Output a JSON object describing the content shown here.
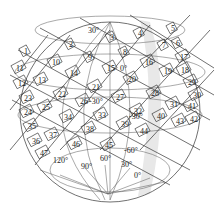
{
  "diagram": {
    "type": "sphere-grid-layout",
    "colors": {
      "stroke": "#333333",
      "background": "#ffffff",
      "shade": "#e6e6e6"
    },
    "panel_labels": [
      {
        "text": "1",
        "x": 24,
        "y": 54
      },
      {
        "text": "2",
        "x": 69,
        "y": 47
      },
      {
        "text": "3",
        "x": 110,
        "y": 40
      },
      {
        "text": "4",
        "x": 138,
        "y": 36
      },
      {
        "text": "5",
        "x": 171,
        "y": 31
      },
      {
        "text": "6",
        "x": 176,
        "y": 46
      },
      {
        "text": "7",
        "x": 162,
        "y": 48
      },
      {
        "text": "8",
        "x": 123,
        "y": 55
      },
      {
        "text": "9",
        "x": 88,
        "y": 60
      },
      {
        "text": "10",
        "x": 52,
        "y": 65
      },
      {
        "text": "11",
        "x": 16,
        "y": 71
      },
      {
        "text": "12",
        "x": 18,
        "y": 86
      },
      {
        "text": "13",
        "x": 38,
        "y": 83
      },
      {
        "text": "14",
        "x": 70,
        "y": 76
      },
      {
        "text": "15",
        "x": 107,
        "y": 71
      },
      {
        "text": "16",
        "x": 145,
        "y": 65
      },
      {
        "text": "17",
        "x": 180,
        "y": 60
      },
      {
        "text": "18",
        "x": 181,
        "y": 73
      },
      {
        "text": "19",
        "x": 164,
        "y": 74
      },
      {
        "text": "20",
        "x": 128,
        "y": 82
      },
      {
        "text": "21",
        "x": 92,
        "y": 90
      },
      {
        "text": "22",
        "x": 58,
        "y": 97
      },
      {
        "text": "23",
        "x": 24,
        "y": 101
      },
      {
        "text": "24",
        "x": 24,
        "y": 115
      },
      {
        "text": "25",
        "x": 42,
        "y": 110
      },
      {
        "text": "26",
        "x": 80,
        "y": 104
      },
      {
        "text": "27",
        "x": 116,
        "y": 100
      },
      {
        "text": "28",
        "x": 151,
        "y": 96
      },
      {
        "text": "29",
        "x": 188,
        "y": 85
      },
      {
        "text": "30",
        "x": 193,
        "y": 98
      },
      {
        "text": "31",
        "x": 170,
        "y": 107
      },
      {
        "text": "32",
        "x": 134,
        "y": 114
      },
      {
        "text": "33",
        "x": 98,
        "y": 118
      },
      {
        "text": "34",
        "x": 64,
        "y": 120
      },
      {
        "text": "35",
        "x": 28,
        "y": 129
      },
      {
        "text": "36",
        "x": 32,
        "y": 144
      },
      {
        "text": "37",
        "x": 49,
        "y": 138
      },
      {
        "text": "38",
        "x": 86,
        "y": 132
      },
      {
        "text": "39",
        "x": 121,
        "y": 127
      },
      {
        "text": "40",
        "x": 157,
        "y": 119
      },
      {
        "text": "41",
        "x": 188,
        "y": 109
      },
      {
        "text": "42",
        "x": 190,
        "y": 122
      },
      {
        "text": "43",
        "x": 176,
        "y": 124
      },
      {
        "text": "44",
        "x": 140,
        "y": 134
      },
      {
        "text": "45",
        "x": 105,
        "y": 148
      },
      {
        "text": "46",
        "x": 72,
        "y": 147
      },
      {
        "text": "47",
        "x": 40,
        "y": 156
      }
    ],
    "angle_labels": [
      {
        "text": "30°",
        "x": 88,
        "y": 33
      },
      {
        "text": "0°",
        "x": 120,
        "y": 71
      },
      {
        "text": "-30°",
        "x": 89,
        "y": 104
      },
      {
        "text": "-30°",
        "x": 129,
        "y": 119
      },
      {
        "text": "-60°",
        "x": 124,
        "y": 153
      },
      {
        "text": "120°",
        "x": 53,
        "y": 163
      },
      {
        "text": "90°",
        "x": 81,
        "y": 169
      },
      {
        "text": "60°",
        "x": 100,
        "y": 161
      },
      {
        "text": "30°",
        "x": 121,
        "y": 167
      },
      {
        "text": "0°",
        "x": 134,
        "y": 178
      }
    ]
  }
}
